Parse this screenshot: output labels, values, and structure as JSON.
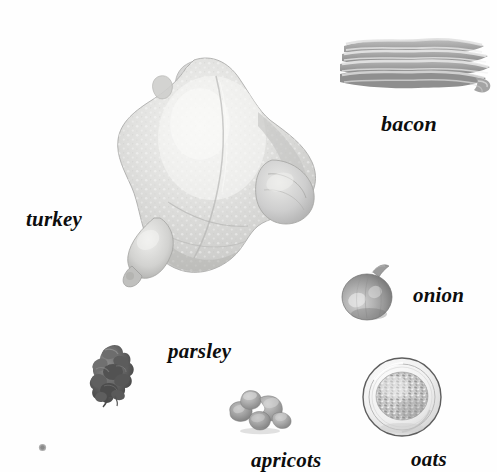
{
  "page": {
    "background_color": "#fefefe",
    "width": 497,
    "height": 472,
    "style": "grayscale halftone food illustration with italic serif labels"
  },
  "labels": {
    "turkey": "turkey",
    "bacon": "bacon",
    "onion": "onion",
    "parsley": "parsley",
    "apricots": "apricots",
    "oats": "oats"
  },
  "items": [
    {
      "name": "turkey",
      "label": "turkey",
      "icon": "whole-raw-turkey-illustration",
      "x": 108,
      "y": 52,
      "width": 220,
      "height": 232,
      "label_x": 26,
      "label_y": 209,
      "color": "#d8d8d8",
      "description": "whole raw turkey, breast up, dimpled skin texture"
    },
    {
      "name": "bacon",
      "label": "bacon",
      "icon": "bacon-strips-illustration",
      "x": 338,
      "y": 34,
      "width": 152,
      "height": 62,
      "label_x": 381,
      "label_y": 113,
      "color": "#b4b4b4",
      "description": "stack of four to five wavy streaky bacon rashers"
    },
    {
      "name": "onion",
      "label": "onion",
      "icon": "onion-bulb-illustration",
      "x": 339,
      "y": 258,
      "width": 58,
      "height": 62,
      "label_x": 413,
      "label_y": 285,
      "color": "#9a9a9a",
      "description": "round onion bulb with short dry stem on top"
    },
    {
      "name": "parsley",
      "label": "parsley",
      "icon": "parsley-sprig-illustration",
      "x": 88,
      "y": 342,
      "width": 46,
      "height": 62,
      "label_x": 168,
      "label_y": 341,
      "color": "#5c5c5c",
      "description": "dark ruffled clump of curly parsley leaves"
    },
    {
      "name": "apricots",
      "label": "apricots",
      "icon": "dried-apricots-illustration",
      "x": 224,
      "y": 388,
      "width": 76,
      "height": 44,
      "label_x": 251,
      "label_y": 450,
      "color": "#a8a8a8",
      "description": "cluster of five dried apricot halves"
    },
    {
      "name": "oats",
      "label": "oats",
      "icon": "bowl-of-oats-illustration",
      "x": 360,
      "y": 356,
      "width": 84,
      "height": 84,
      "label_x": 411,
      "label_y": 449,
      "color": "#bdbdbd",
      "description": "shallow round glass bowl filled with rolled oats"
    },
    {
      "name": "speck",
      "label": "",
      "icon": "gray-speck-artifact",
      "x": 38,
      "y": 443,
      "width": 8,
      "height": 8,
      "color": "#9e9e9e",
      "description": "small stray gray dot near lower-left corner"
    }
  ]
}
